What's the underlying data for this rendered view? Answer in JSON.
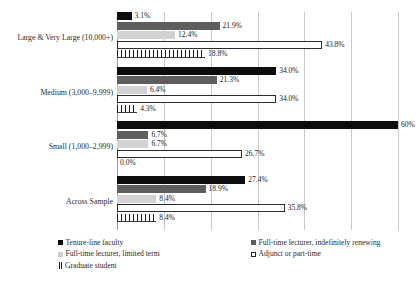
{
  "chart_data": {
    "type": "bar",
    "orientation": "horizontal",
    "title": "",
    "subtitle": "",
    "xlabel": "",
    "ylabel": "",
    "xlim": [
      0,
      60
    ],
    "grid": true,
    "gridline_step": 10,
    "grid_values": [
      0,
      10,
      20,
      30,
      40,
      50,
      60
    ],
    "legend_position": "bottom",
    "categories": [
      "Large & Very Large (10,000+)",
      "Medium (3,000–9,999)",
      "Small (1,000–2,999)",
      "Across Sample"
    ],
    "series": [
      {
        "name": "Tenure-line faculty",
        "style": "solid-black",
        "color": "#0d0d0d",
        "values": [
          3.1,
          34.0,
          60.0,
          27.4
        ],
        "labels": [
          "3.1%",
          "34.0%",
          "60%",
          "27.4%"
        ]
      },
      {
        "name": "Full-time lecturer, indefinitely renewing",
        "style": "solid-dark-gray",
        "color": "#5e5e5e",
        "values": [
          21.9,
          21.3,
          6.7,
          18.9
        ],
        "labels": [
          "21.9%",
          "21.3%",
          "6.7%",
          "18.9%"
        ]
      },
      {
        "name": "Full-time lecturer, limited term",
        "style": "solid-light-gray",
        "color": "#d2d2d2",
        "values": [
          12.4,
          6.4,
          6.7,
          8.4
        ],
        "labels": [
          "12.4%",
          "6.4%",
          "6.7%",
          "8.4%"
        ]
      },
      {
        "name": "Adjunct or part-time",
        "style": "outlined-white",
        "color": "#ffffff",
        "values": [
          43.8,
          34.0,
          26.7,
          35.8
        ],
        "labels": [
          "43.8%",
          "34.0%",
          "26.7%",
          "35.8%"
        ]
      },
      {
        "name": "Graduate student",
        "style": "vertical-hatch",
        "color": "#1a1a1a",
        "values": [
          18.8,
          4.3,
          0.0,
          8.4
        ],
        "labels": [
          "18.8%",
          "4.3%",
          "0.0%",
          "8.4%"
        ]
      }
    ]
  },
  "legend": {
    "left_column": [
      "Tenure-line faculty",
      "Full-time lecturer, limited term",
      "Graduate student"
    ],
    "right_column": [
      "Full-time lecturer, indefinitely renewing",
      "Adjunct or part-time"
    ]
  }
}
